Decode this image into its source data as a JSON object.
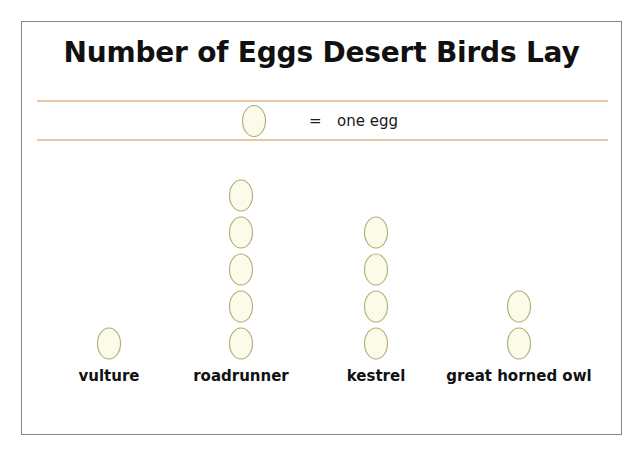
{
  "chart_data": {
    "type": "pictograph",
    "title": "Number of Eggs Desert Birds Lay",
    "categories": [
      "vulture",
      "roadrunner",
      "kestrel",
      "great horned owl"
    ],
    "values": [
      1,
      5,
      4,
      2
    ],
    "xlabel": "",
    "ylabel": "",
    "unit_per_icon": 1,
    "icon": "egg-icon",
    "legend": {
      "equals_sign": "=",
      "unit_label": "one egg"
    },
    "grid": false,
    "legend_position": "top"
  },
  "colors": {
    "egg_fill": "#fbfbe9",
    "egg_stroke": "#b3a874",
    "legend_rule": "#e7c9a5",
    "frame_border": "#858585",
    "text": "#111111",
    "background": "#ffffff"
  }
}
